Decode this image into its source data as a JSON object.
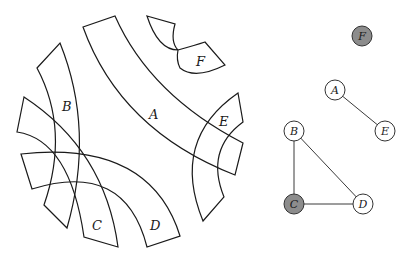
{
  "interval_diagram": {
    "bands": [
      {
        "id": "A",
        "label": "A"
      },
      {
        "id": "B",
        "label": "B"
      },
      {
        "id": "C",
        "label": "C"
      },
      {
        "id": "D",
        "label": "D"
      },
      {
        "id": "E",
        "label": "E"
      },
      {
        "id": "F",
        "label": "F"
      }
    ]
  },
  "graph": {
    "nodes": [
      {
        "id": "F",
        "label": "F",
        "shaded": true,
        "fill": "#8c8c8c"
      },
      {
        "id": "A",
        "label": "A",
        "shaded": false,
        "fill": "#ffffff"
      },
      {
        "id": "E",
        "label": "E",
        "shaded": false,
        "fill": "#ffffff"
      },
      {
        "id": "B",
        "label": "B",
        "shaded": false,
        "fill": "#ffffff"
      },
      {
        "id": "C",
        "label": "C",
        "shaded": true,
        "fill": "#8c8c8c"
      },
      {
        "id": "D",
        "label": "D",
        "shaded": false,
        "fill": "#ffffff"
      }
    ],
    "edges": [
      {
        "from": "A",
        "to": "E"
      },
      {
        "from": "B",
        "to": "C"
      },
      {
        "from": "B",
        "to": "D"
      },
      {
        "from": "C",
        "to": "D"
      }
    ]
  }
}
